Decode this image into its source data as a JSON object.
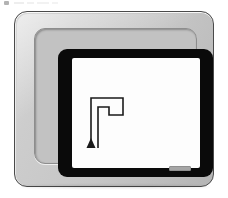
{
  "scene": {
    "description": "CRT computer monitor displaying turtle-graphics line drawing",
    "background_color": "#ffffff",
    "width": 228,
    "height": 198
  },
  "monitor": {
    "case_label": "monitor-case",
    "case_color": "#c6c6c6",
    "case_outline_color": "#4a4a4a",
    "recess_color": "#c2c2c2",
    "bezel_color": "#0a0a0a",
    "screen_color": "#fdfdfd",
    "brand_badge_text": "",
    "brand_badge_color": "#a6a6a6"
  },
  "screen_drawing": {
    "title": "turtle-graphics-path",
    "stroke_color": "#1a1a1a",
    "stroke_width": 1.6,
    "turtle": {
      "label": "turtle-cursor",
      "shape": "triangle",
      "heading": "up",
      "x": 19,
      "y": 88,
      "width": 9,
      "height": 9,
      "fill": "#1a1a1a"
    },
    "path_points": [
      {
        "x": 19,
        "y": 88
      },
      {
        "x": 19,
        "y": 40
      },
      {
        "x": 51,
        "y": 40
      },
      {
        "x": 51,
        "y": 57
      },
      {
        "x": 37,
        "y": 57
      },
      {
        "x": 37,
        "y": 49
      },
      {
        "x": 26,
        "y": 49
      },
      {
        "x": 26,
        "y": 90
      }
    ],
    "path_d": "M 19 88 L 19 40 L 51 40 L 51 57 L 37 57 L 37 49 L 26 49 L 26 90"
  },
  "scan_artifacts": {
    "label": "page-scan-artifacts",
    "visible": true,
    "count": 5
  }
}
